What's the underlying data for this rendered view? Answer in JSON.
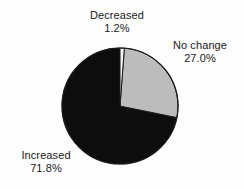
{
  "chart_data": {
    "type": "pie",
    "title": "",
    "subtitle": "",
    "xlabel": "",
    "ylabel": "",
    "legend_position": "none",
    "grid": false,
    "labels_on_slices": false,
    "start_angle_deg": 0,
    "direction": "clockwise",
    "categories": [
      "Decreased",
      "No change",
      "Increased"
    ],
    "values": [
      1.2,
      27.0,
      71.8
    ],
    "value_unit": "percent",
    "value_labels": [
      "1.2%",
      "27.0%",
      "71.8%"
    ],
    "colors": [
      "#f2f2f2",
      "#bcbcbc",
      "#0d0d0d"
    ],
    "slices": [
      {
        "name": "Decreased",
        "value": 1.2,
        "value_label": "1.2%",
        "color": "#f2f2f2",
        "start_deg": 0.0,
        "end_deg": 4.32
      },
      {
        "name": "No change",
        "value": 27.0,
        "value_label": "27.0%",
        "color": "#bcbcbc",
        "start_deg": 4.32,
        "end_deg": 101.52
      },
      {
        "name": "Increased",
        "value": 71.8,
        "value_label": "71.8%",
        "color": "#0d0d0d",
        "start_deg": 101.52,
        "end_deg": 360.0
      }
    ]
  },
  "figure": {
    "background_color": "#fdfdfd",
    "outline_color": "#1a1a1a",
    "text_color": "#1a1a1a"
  },
  "labels": {
    "decreased": {
      "name": "Decreased",
      "percent": "1.2%"
    },
    "nochange": {
      "name": "No change",
      "percent": "27.0%"
    },
    "increased": {
      "name": "Increased",
      "percent": "71.8%"
    }
  }
}
